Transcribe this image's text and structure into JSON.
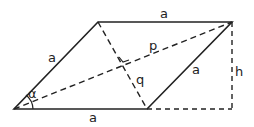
{
  "diagram": {
    "labels": {
      "top_side": "a",
      "left_side": "a",
      "right_side": "a",
      "bottom_side": "a",
      "diagonal_long": "p",
      "diagonal_short": "q",
      "height": "h",
      "angle": "α"
    },
    "colors": {
      "stroke": "#222222",
      "background": "#ffffff"
    }
  }
}
